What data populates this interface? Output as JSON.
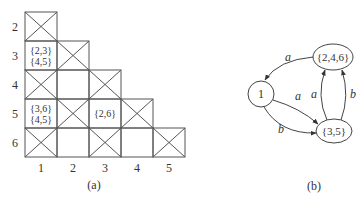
{
  "table": {
    "caption": "(a)",
    "row_labels": [
      "2",
      "3",
      "4",
      "5",
      "6"
    ],
    "col_labels": [
      "1",
      "2",
      "3",
      "4",
      "5"
    ],
    "cells": [
      [
        {
          "mark": "x"
        }
      ],
      [
        {
          "mark": "text",
          "lines": [
            "{2,3}",
            "{4,5}"
          ]
        },
        {
          "mark": "x"
        }
      ],
      [
        {
          "mark": "x"
        },
        {
          "mark": "empty"
        },
        {
          "mark": "x"
        }
      ],
      [
        {
          "mark": "text",
          "lines": [
            "{3,6}",
            "{4,5}"
          ]
        },
        {
          "mark": "x"
        },
        {
          "mark": "text",
          "lines": [
            "{2,6}"
          ]
        },
        {
          "mark": "x"
        }
      ],
      [
        {
          "mark": "x"
        },
        {
          "mark": "empty"
        },
        {
          "mark": "x"
        },
        {
          "mark": "empty"
        },
        {
          "mark": "x"
        }
      ]
    ]
  },
  "graph": {
    "caption": "(b)",
    "nodes": [
      {
        "id": "n1",
        "label": "1"
      },
      {
        "id": "n246",
        "label": "{2,4,6}"
      },
      {
        "id": "n35",
        "label": "{3,5}"
      }
    ],
    "edges": [
      {
        "from": "n246",
        "to": "n1",
        "label": "a"
      },
      {
        "from": "n1",
        "to": "n35",
        "label": "a"
      },
      {
        "from": "n1",
        "to": "n35",
        "label": "b"
      },
      {
        "from": "n35",
        "to": "n246",
        "label": "a"
      },
      {
        "from": "n35",
        "to": "n246",
        "label": "b"
      }
    ]
  }
}
